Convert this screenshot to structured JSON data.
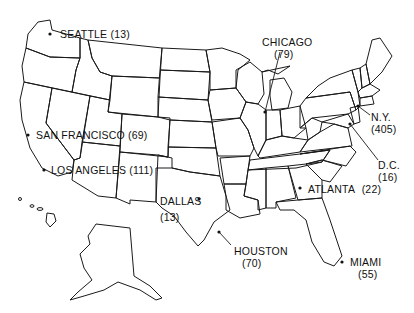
{
  "map": {
    "region": "United States",
    "colors": {
      "stroke": "#1a1a1a",
      "background": "#ffffff",
      "text": "#111111"
    },
    "cities": [
      {
        "id": "seattle",
        "name": "SEATTLE",
        "count": "(13)",
        "inline": true
      },
      {
        "id": "chicago",
        "name": "CHICAGO",
        "count": "(79)",
        "inline": false
      },
      {
        "id": "new-york",
        "name": "N.Y.",
        "count": "(405)",
        "inline": false
      },
      {
        "id": "san-francisco",
        "name": "SAN FRANCISCO",
        "count": "(69)",
        "inline": true
      },
      {
        "id": "los-angeles",
        "name": "LOS ANGELES",
        "count": "(111)",
        "inline": true
      },
      {
        "id": "washington-dc",
        "name": "D.C.",
        "count": "(16)",
        "inline": false
      },
      {
        "id": "atlanta",
        "name": "ATLANTA",
        "count": "(22)",
        "inline": true
      },
      {
        "id": "dallas",
        "name": "DALLAS",
        "count": "(13)",
        "inline": false
      },
      {
        "id": "houston",
        "name": "HOUSTON",
        "count": "(70)",
        "inline": false
      },
      {
        "id": "miami",
        "name": "MIAMI",
        "count": "(55)",
        "inline": false
      }
    ]
  }
}
